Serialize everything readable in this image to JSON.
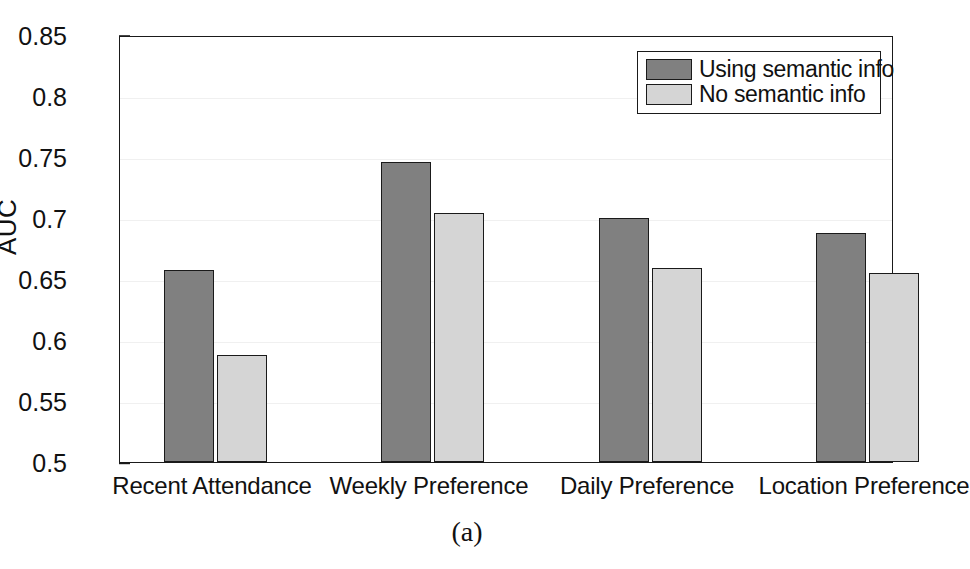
{
  "figure": {
    "caption": "(a)",
    "ylabel": "AUC"
  },
  "legend": {
    "position": "top-right",
    "entries": [
      {
        "label": "Using semantic info",
        "color": "#808080"
      },
      {
        "label": "No semantic info",
        "color": "#d5d5d5"
      }
    ]
  },
  "axis": {
    "yticks": [
      "0.5",
      "0.55",
      "0.6",
      "0.65",
      "0.7",
      "0.75",
      "0.8",
      "0.85"
    ],
    "ytick_values": [
      0.5,
      0.55,
      0.6,
      0.65,
      0.7,
      0.75,
      0.8,
      0.85
    ],
    "ymin": 0.5,
    "ymax": 0.85
  },
  "chart_data": {
    "type": "bar",
    "title": "",
    "subtitle": "",
    "xlabel": "",
    "ylabel": "AUC",
    "ylim": [
      0.5,
      0.85
    ],
    "ytick_labels": [
      "0.5",
      "0.55",
      "0.6",
      "0.65",
      "0.7",
      "0.75",
      "0.8",
      "0.85"
    ],
    "grid": true,
    "grid_axis": "y",
    "legend_position": "upper right",
    "categories": [
      "Recent Attendance",
      "Weekly Preference",
      "Daily Preference",
      "Location Preference"
    ],
    "series": [
      {
        "name": "Using semantic info",
        "color": "#808080",
        "values": [
          0.657,
          0.746,
          0.7,
          0.688
        ]
      },
      {
        "name": "No semantic info",
        "color": "#d5d5d5",
        "values": [
          0.588,
          0.704,
          0.659,
          0.655
        ]
      }
    ],
    "annotations": [
      "(a)"
    ]
  },
  "layout": {
    "plot_left": 119,
    "plot_top": 36,
    "plot_width": 774,
    "plot_height": 427,
    "bar_width": 50,
    "group_centers": [
      213,
      430,
      648,
      865
    ]
  }
}
